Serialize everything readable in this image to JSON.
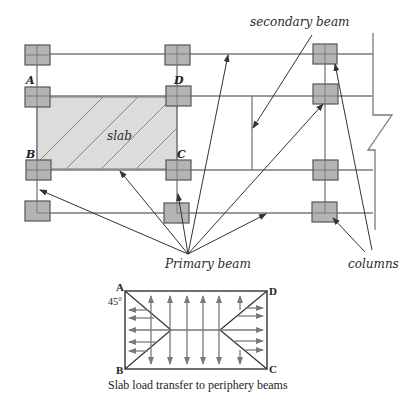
{
  "plan": {
    "labels": {
      "secondary_beam": "secondary beam",
      "slab": "slab",
      "primary_beam": "Primary beam",
      "columns": "columns"
    },
    "corners": {
      "a": "A",
      "b": "B",
      "c": "C",
      "d": "D"
    }
  },
  "load_diagram": {
    "corners": {
      "a": "A",
      "b": "B",
      "c": "C",
      "d": "D"
    },
    "angle_label": "45°",
    "caption": "Slab load transfer to periphery beams"
  },
  "colors": {
    "column_fill": "#b4b4b4",
    "column_stroke": "#555555",
    "slab_fill": "#dcdcdc",
    "line": "#6e6e6e",
    "arrow": "#7a7a7a"
  }
}
